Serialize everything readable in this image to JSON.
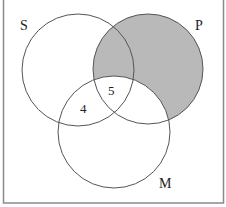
{
  "diagram": {
    "type": "venn-3",
    "sets": [
      {
        "id": "S",
        "label": "S",
        "cx": 78,
        "cy": 70,
        "r": 56
      },
      {
        "id": "P",
        "label": "P",
        "cx": 148,
        "cy": 69,
        "r": 55
      },
      {
        "id": "M",
        "label": "M",
        "cx": 114,
        "cy": 132,
        "r": 56
      }
    ],
    "region_labels": [
      {
        "region": "S∩M∖P",
        "text": "4"
      },
      {
        "region": "S∩P∩M",
        "text": "5"
      }
    ],
    "shaded_region": "P∖M",
    "colors": {
      "shade": "#b9b9b9",
      "stroke": "#555555",
      "frame": "#8a8a8a",
      "background": "#ffffff"
    }
  }
}
